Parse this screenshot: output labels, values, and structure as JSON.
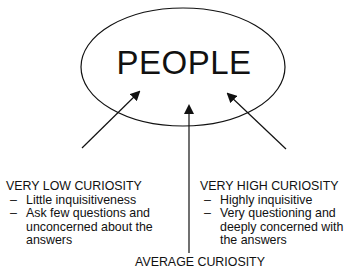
{
  "center": {
    "label": "PEOPLE"
  },
  "categories": {
    "low": {
      "heading": "VERY LOW CURIOSITY",
      "points": [
        "Little inquisitiveness",
        "Ask few questions and unconcerned about the answers"
      ]
    },
    "high": {
      "heading": "VERY HIGH CURIOSITY",
      "points": [
        "Highly inquisitive",
        "Very questioning and deeply concerned with the answers"
      ]
    },
    "average": {
      "heading": "AVERAGE CURIOSITY"
    }
  },
  "colors": {
    "stroke": "#111111",
    "background": "#ffffff"
  }
}
